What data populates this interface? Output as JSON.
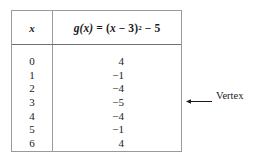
{
  "table": {
    "columns": [
      {
        "header": "x",
        "name": "x-column"
      },
      {
        "header": "g(x) = (x − 3)² − 5",
        "name": "gx-column"
      }
    ],
    "header_gx": {
      "g": "g",
      "open_paren_x": "(x)",
      "equals": "=",
      "expr_open": "(",
      "var_x": "x",
      "minus_one": "−",
      "three": "3",
      "expr_close": ")",
      "exponent": "2",
      "minus_two": "−",
      "five": "5"
    },
    "rows": [
      {
        "x": "0",
        "gx": "4"
      },
      {
        "x": "1",
        "gx": "−1"
      },
      {
        "x": "2",
        "gx": "−4"
      },
      {
        "x": "3",
        "gx": "−5"
      },
      {
        "x": "4",
        "gx": "−4"
      },
      {
        "x": "5",
        "gx": "−1"
      },
      {
        "x": "6",
        "gx": "4"
      }
    ]
  },
  "annotation": {
    "arrow": "left-arrow-icon",
    "label": "Vertex",
    "points_to_row": "3"
  },
  "colors": {
    "background": "#ffffff",
    "text": "#1a1a1a",
    "border": "#9a9a9a",
    "rule": "#6f6f6f"
  }
}
